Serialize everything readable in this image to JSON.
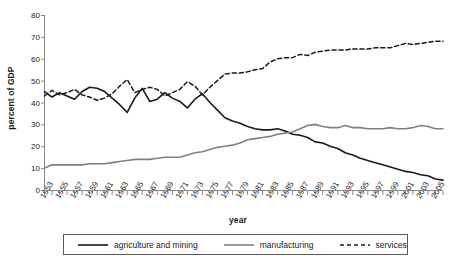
{
  "chart_data": {
    "type": "line",
    "title": "",
    "xlabel": "year",
    "ylabel": "percent of GDP",
    "xlim": [
      1953,
      2006
    ],
    "ylim": [
      0,
      80
    ],
    "ytick_step": 10,
    "yticks": [
      0,
      10,
      20,
      30,
      40,
      50,
      60,
      70,
      80
    ],
    "xticks": [
      1953,
      1955,
      1957,
      1959,
      1961,
      1963,
      1965,
      1967,
      1969,
      1971,
      1973,
      1975,
      1977,
      1979,
      1981,
      1983,
      1985,
      1987,
      1989,
      1991,
      1993,
      1995,
      1997,
      1999,
      2001,
      2003,
      2005
    ],
    "x": [
      1953,
      1954,
      1955,
      1956,
      1957,
      1958,
      1959,
      1960,
      1961,
      1962,
      1963,
      1964,
      1965,
      1966,
      1967,
      1968,
      1969,
      1970,
      1971,
      1972,
      1973,
      1974,
      1975,
      1976,
      1977,
      1978,
      1979,
      1980,
      1981,
      1982,
      1983,
      1984,
      1985,
      1986,
      1987,
      1988,
      1989,
      1990,
      1991,
      1992,
      1993,
      1994,
      1995,
      1996,
      1997,
      1998,
      1999,
      2000,
      2001,
      2002,
      2003,
      2004,
      2005,
      2006
    ],
    "grid": false,
    "legend_position": "bottom",
    "series": [
      {
        "name": "agriculture and mining",
        "style": "solid",
        "color": "#1a1a1a",
        "values": [
          45,
          42.5,
          44.5,
          43,
          41.5,
          45,
          47,
          46.5,
          45,
          42,
          39,
          35.5,
          42,
          46.5,
          40.5,
          41.5,
          44.5,
          42,
          40.5,
          37.5,
          41.5,
          44,
          40,
          36.5,
          33,
          31.5,
          30.5,
          29,
          28,
          27.5,
          27.5,
          28,
          27,
          25.5,
          25,
          24,
          22,
          21.5,
          20,
          19,
          17,
          16,
          14.5,
          13.5,
          12.5,
          11.5,
          10.5,
          9.5,
          8.5,
          8,
          7,
          6.5,
          5,
          4.5
        ]
      },
      {
        "name": "manufacturing",
        "style": "solid",
        "color": "#808080",
        "values": [
          10,
          11.5,
          11.5,
          11.5,
          11.5,
          11.5,
          12,
          12,
          12,
          12.5,
          13,
          13.5,
          14,
          14,
          14,
          14.5,
          15,
          15,
          15,
          16,
          17,
          17.5,
          18.5,
          19.5,
          20,
          20.5,
          21.5,
          23,
          23.5,
          24,
          24.5,
          25.5,
          26,
          26.5,
          28,
          29.5,
          30,
          29,
          28.5,
          28.5,
          29.5,
          28.5,
          28.5,
          28,
          28,
          28,
          28.5,
          28,
          28,
          28.5,
          29.5,
          29,
          28,
          28
        ]
      },
      {
        "name": "services",
        "style": "dashed",
        "color": "#1a1a1a",
        "values": [
          43,
          45.5,
          43.5,
          44.5,
          46,
          43.5,
          42.5,
          41,
          42,
          44,
          47.5,
          50.5,
          44.5,
          46,
          47,
          46,
          43,
          44.5,
          46,
          49.5,
          47.5,
          43.5,
          47,
          50,
          53,
          53.5,
          53.5,
          54,
          55,
          55.5,
          58.5,
          60,
          60.5,
          60.5,
          62,
          61.5,
          63,
          63.5,
          64,
          64,
          64,
          64.5,
          64.5,
          64.5,
          65,
          65,
          65,
          66,
          67,
          66.5,
          67,
          67.5,
          68,
          68
        ]
      }
    ]
  },
  "legend": {
    "items": [
      {
        "label": "agriculture and mining"
      },
      {
        "label": "manufacturing"
      },
      {
        "label": "services"
      }
    ]
  }
}
